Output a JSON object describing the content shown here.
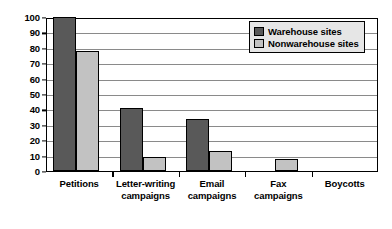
{
  "chart_data": {
    "type": "bar",
    "title": "",
    "subtitle": "",
    "xlabel": "",
    "ylabel": "",
    "ylim": [
      0,
      100
    ],
    "yticks": [
      0,
      10,
      20,
      30,
      40,
      50,
      60,
      70,
      80,
      90,
      100
    ],
    "grid": true,
    "legend_position": "top-right",
    "categories": [
      "Petitions",
      "Letter-writing campaigns",
      "Email campaigns",
      "Fax campaigns",
      "Boycotts"
    ],
    "category_lines": [
      [
        "Petitions"
      ],
      [
        "Letter-writing",
        "campaigns"
      ],
      [
        "Email",
        "campaigns"
      ],
      [
        "Fax",
        "campaigns"
      ],
      [
        "Boycotts"
      ]
    ],
    "series": [
      {
        "name": "Warehouse sites",
        "color": "#595959",
        "values": [
          100,
          41,
          34,
          0,
          0
        ]
      },
      {
        "name": "Nonwarehouse sites",
        "color": "#c2c2c2",
        "values": [
          78,
          9,
          13,
          8,
          0
        ]
      }
    ]
  },
  "legend": {
    "items": [
      {
        "label": "Warehouse sites",
        "swatch": "dark"
      },
      {
        "label": "Nonwarehouse sites",
        "swatch": "light"
      }
    ]
  },
  "axis": {
    "y_tick_labels": [
      "0",
      "10",
      "20",
      "30",
      "40",
      "50",
      "60",
      "70",
      "80",
      "90",
      "100"
    ]
  }
}
